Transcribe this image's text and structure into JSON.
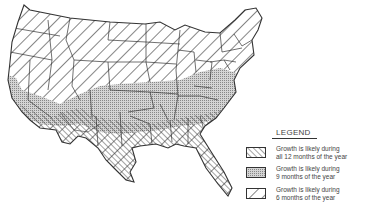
{
  "map": {
    "subject": "Contiguous United States",
    "regions": [
      {
        "name": "north-and-west",
        "pattern": "hatch-back-wide",
        "category": 2
      },
      {
        "name": "mid-south-band",
        "pattern": "stipple",
        "category": 1
      },
      {
        "name": "gulf-coast-and-southwest",
        "pattern": "hatch-forward-fine",
        "category": 0
      }
    ]
  },
  "legend": {
    "title": "LEGEND",
    "items": [
      {
        "pattern": "hatch-forward-fine",
        "line1": "Growth is likely during",
        "line2": "all 12 months of the year"
      },
      {
        "pattern": "stipple",
        "line1": "Growth is likely during",
        "line2": "9 months of the year"
      },
      {
        "pattern": "hatch-back-wide",
        "line1": "Growth is likely during",
        "line2": "6 months of the year"
      }
    ]
  },
  "colors": {
    "line": "#333333",
    "stipple": "#bdbdbd",
    "background": "#ffffff"
  }
}
